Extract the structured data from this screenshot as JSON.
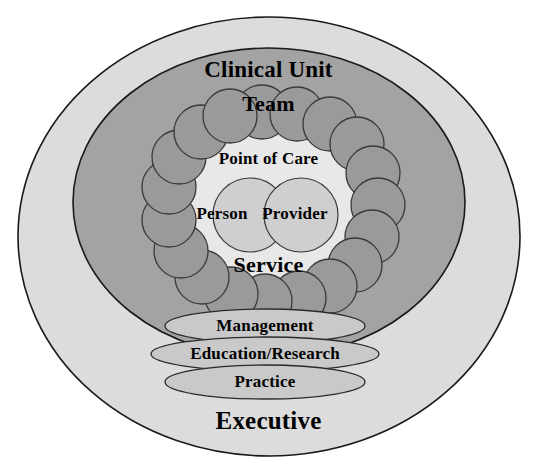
{
  "diagram": {
    "title_text_present": false,
    "colors": {
      "background": "#ffffff",
      "outer_ellipse_fill": "#dcdcdc",
      "middle_ellipse_fill": "#a3a3a3",
      "inner_core_fill": "#e8e8e8",
      "team_circle_fill": "#9a9a9a",
      "core_circle_fill": "#cfcfcf",
      "band_ellipse_fill": "#c9c9c9",
      "stroke": "#1a1a1a",
      "text": "#000000"
    },
    "layers": {
      "outer": {
        "label": "Executive"
      },
      "middle": {
        "label": "Clinical Unit"
      },
      "team_ring": {
        "label": "Team",
        "circle_count": 19
      },
      "core": {
        "heading": "Point of Care",
        "footing": "Service",
        "circles": [
          {
            "label": "Person"
          },
          {
            "label": "Provider"
          }
        ]
      },
      "bands": [
        {
          "label": "Management"
        },
        {
          "label": "Education/Research"
        },
        {
          "label": "Practice"
        }
      ]
    }
  }
}
